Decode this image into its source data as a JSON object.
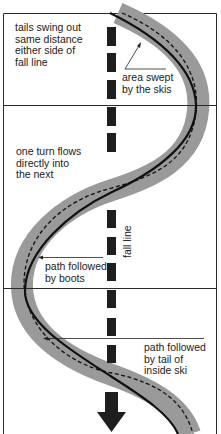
{
  "figure": {
    "type": "skiing turn diagram",
    "colors": {
      "frame": "#2a2a2a",
      "band": "#9a9a9a",
      "path": "#111111",
      "fall_line": "#1e1e1e",
      "text": "#222222"
    },
    "labels": {
      "tails_swing": "tails swing out\nsame distance\neither side of\nfall line",
      "area_swept": "area swept\nby the skis",
      "one_turn": "one turn flows\ndirectly into\nthe next",
      "fall_line": "fall line",
      "boots_path": "path followed\nby boots",
      "tail_path": "path followed\nby tail of\ninside ski"
    },
    "legend": [
      {
        "element": "gray band",
        "meaning": "area swept by the skis"
      },
      {
        "element": "solid line",
        "meaning": "path followed by boots"
      },
      {
        "element": "dashed line",
        "meaning": "path followed by tail of inside ski"
      },
      {
        "element": "dashed vertical with arrow",
        "meaning": "fall line"
      }
    ]
  }
}
